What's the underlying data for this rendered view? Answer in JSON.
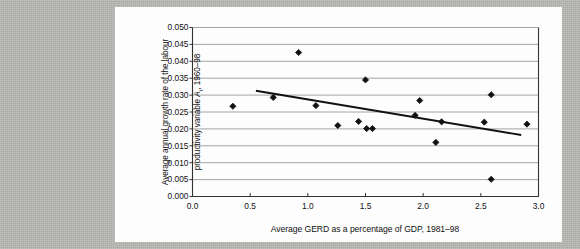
{
  "figure": {
    "background_color": "#b8b8b4",
    "card_color": "#fdfdfd",
    "marker_color": "#111111",
    "trendline_color": "#111111",
    "gridline_color": "#9a9a9a",
    "axis_color": "#555555"
  },
  "chart_data": {
    "type": "scatter",
    "title": "",
    "xlabel": "Average GERD as a percentage of GDP, 1981–98",
    "ylabel_line1": "Average annual growth rate of the labour",
    "ylabel_line2_pre": "productivity variable ",
    "ylabel_line2_var": "A",
    "ylabel_line2_sub": "t",
    "ylabel_line2_post": ", 1960–98",
    "xlim": [
      0.0,
      3.0
    ],
    "ylim": [
      0.0,
      0.05
    ],
    "xticks": [
      "0.0",
      "0.5",
      "1.0",
      "1.5",
      "2.0",
      "2.5",
      "3.0"
    ],
    "xtick_values": [
      0.0,
      0.5,
      1.0,
      1.5,
      2.0,
      2.5,
      3.0
    ],
    "yticks": [
      "0.000",
      "0.005",
      "0.010",
      "0.015",
      "0.020",
      "0.025",
      "0.030",
      "0.035",
      "0.040",
      "0.045",
      "0.050"
    ],
    "ytick_values": [
      0.0,
      0.005,
      0.01,
      0.015,
      0.02,
      0.025,
      0.03,
      0.035,
      0.04,
      0.045,
      0.05
    ],
    "grid": "horizontal",
    "legend": "none",
    "marker": "diamond",
    "points": [
      {
        "x": 0.35,
        "y": 0.0267
      },
      {
        "x": 0.7,
        "y": 0.0293
      },
      {
        "x": 0.92,
        "y": 0.0426
      },
      {
        "x": 1.07,
        "y": 0.0269
      },
      {
        "x": 1.26,
        "y": 0.021
      },
      {
        "x": 1.44,
        "y": 0.0222
      },
      {
        "x": 1.5,
        "y": 0.0345
      },
      {
        "x": 1.51,
        "y": 0.0201
      },
      {
        "x": 1.56,
        "y": 0.0201
      },
      {
        "x": 1.93,
        "y": 0.024
      },
      {
        "x": 1.97,
        "y": 0.0284
      },
      {
        "x": 2.11,
        "y": 0.016
      },
      {
        "x": 2.16,
        "y": 0.0221
      },
      {
        "x": 2.53,
        "y": 0.022
      },
      {
        "x": 2.59,
        "y": 0.0301
      },
      {
        "x": 2.59,
        "y": 0.0051
      },
      {
        "x": 2.9,
        "y": 0.0214
      }
    ],
    "trendline": {
      "x0": 0.55,
      "y0": 0.0313,
      "x1": 2.85,
      "y1": 0.0182
    }
  }
}
